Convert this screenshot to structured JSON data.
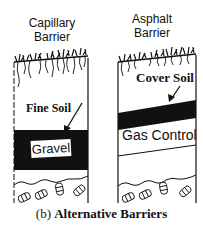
{
  "panels": [
    {
      "title_line1": "Capillary",
      "title_line2": "Barrier",
      "layers": {
        "upper": "Fine Soil",
        "lower": "Gravel"
      }
    },
    {
      "title_line1": "Asphalt",
      "title_line2": "Barrier",
      "layers": {
        "upper": "Cover Soil",
        "lower": "Gas Control"
      }
    }
  ],
  "caption": {
    "prefix": "(b)",
    "text": "Alternative Barriers"
  },
  "colors": {
    "ink": "#111111",
    "background": "#ffffff"
  }
}
